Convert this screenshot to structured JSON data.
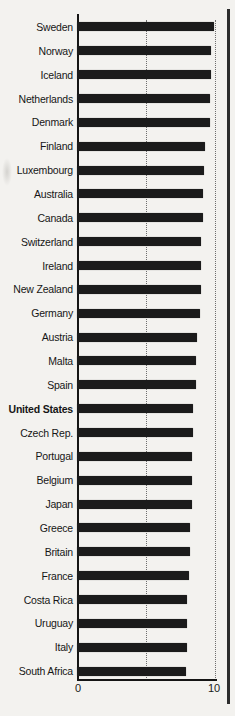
{
  "chart_data": {
    "type": "bar",
    "orientation": "horizontal",
    "title": "",
    "xlabel": "",
    "ylabel": "",
    "xlim": [
      0,
      10
    ],
    "x_tick_labels": [
      "0",
      "10"
    ],
    "gridlines_at": [
      5,
      10
    ],
    "grid_style": "dotted",
    "legend": "none",
    "highlight_category": "United States",
    "categories": [
      "Sweden",
      "Norway",
      "Iceland",
      "Netherlands",
      "Denmark",
      "Finland",
      "Luxembourg",
      "Australia",
      "Canada",
      "Switzerland",
      "Ireland",
      "New Zealand",
      "Germany",
      "Austria",
      "Malta",
      "Spain",
      "United States",
      "Czech Rep.",
      "Portugal",
      "Belgium",
      "Japan",
      "Greece",
      "Britain",
      "France",
      "Costa Rica",
      "Uruguay",
      "Italy",
      "South Africa"
    ],
    "values": [
      9.9,
      9.7,
      9.7,
      9.6,
      9.6,
      9.3,
      9.2,
      9.1,
      9.1,
      9.0,
      9.0,
      9.0,
      8.9,
      8.7,
      8.6,
      8.6,
      8.4,
      8.4,
      8.3,
      8.3,
      8.3,
      8.2,
      8.2,
      8.1,
      8.0,
      8.0,
      8.0,
      7.9
    ]
  },
  "colors": {
    "bar": "#1b1b1b",
    "background": "#f3f2ef",
    "axis": "#151515",
    "gridline": "#6e6e6e",
    "page_rule": "#2c2c2c"
  }
}
